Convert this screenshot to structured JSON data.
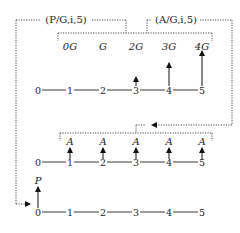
{
  "factors": {
    "pg_label": "(P/G,i,5)",
    "ag_label": "(A/G,i,5)"
  },
  "gradient_series": {
    "labels": [
      "0G",
      "G",
      "2G",
      "3G",
      "4G"
    ],
    "periods": [
      "0",
      "1",
      "2",
      "3",
      "4",
      "5"
    ]
  },
  "annuity_series": {
    "labels": [
      "A",
      "A",
      "A",
      "A",
      "A"
    ],
    "periods": [
      "0",
      "1",
      "2",
      "3",
      "4",
      "5"
    ]
  },
  "present_worth": {
    "label": "P",
    "periods": [
      "0",
      "1",
      "2",
      "3",
      "4",
      "5"
    ]
  }
}
